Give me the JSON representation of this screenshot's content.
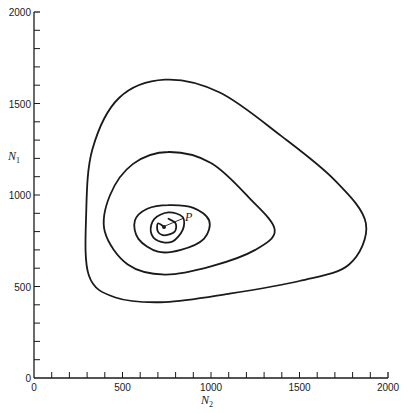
{
  "chart_data": {
    "type": "line",
    "title": "",
    "xlabel": "N2",
    "ylabel": "N1",
    "xlim": [
      0,
      2000
    ],
    "ylim": [
      0,
      2000
    ],
    "grid": false,
    "legend": null,
    "x_ticks": [
      0,
      500,
      1000,
      1500,
      2000
    ],
    "y_ticks": [
      0,
      500,
      1000,
      1500,
      2000
    ],
    "x_minor_step": 100,
    "y_minor_step": 100,
    "annotations": [
      {
        "text": "P",
        "x": 735,
        "y": 825,
        "description": "equilibrium point (spiral center)"
      }
    ],
    "series": [
      {
        "name": "trajectory-loop-1 (outer)",
        "points": [
          [
            740,
            1630
          ],
          [
            1050,
            1560
          ],
          [
            1400,
            1320
          ],
          [
            1700,
            1080
          ],
          [
            1875,
            845
          ],
          [
            1780,
            620
          ],
          [
            1500,
            530
          ],
          [
            1100,
            460
          ],
          [
            740,
            415
          ],
          [
            460,
            440
          ],
          [
            310,
            560
          ],
          [
            295,
            900
          ],
          [
            330,
            1250
          ],
          [
            480,
            1530
          ],
          [
            740,
            1630
          ]
        ]
      },
      {
        "name": "trajectory-loop-2",
        "points": [
          [
            760,
            1235
          ],
          [
            1000,
            1175
          ],
          [
            1220,
            980
          ],
          [
            1360,
            810
          ],
          [
            1250,
            700
          ],
          [
            1000,
            610
          ],
          [
            740,
            565
          ],
          [
            530,
            620
          ],
          [
            400,
            800
          ],
          [
            430,
            1000
          ],
          [
            560,
            1170
          ],
          [
            760,
            1235
          ]
        ]
      },
      {
        "name": "trajectory-loop-3",
        "points": [
          [
            760,
            945
          ],
          [
            900,
            930
          ],
          [
            990,
            860
          ],
          [
            960,
            760
          ],
          [
            830,
            700
          ],
          [
            700,
            690
          ],
          [
            590,
            760
          ],
          [
            570,
            860
          ],
          [
            640,
            925
          ],
          [
            760,
            945
          ]
        ]
      },
      {
        "name": "trajectory-loop-4",
        "points": [
          [
            760,
            905
          ],
          [
            840,
            880
          ],
          [
            840,
            810
          ],
          [
            780,
            745
          ],
          [
            700,
            750
          ],
          [
            660,
            800
          ],
          [
            680,
            870
          ],
          [
            760,
            905
          ]
        ]
      },
      {
        "name": "trajectory-loop-5 (inner)",
        "points": [
          [
            760,
            870
          ],
          [
            800,
            845
          ],
          [
            795,
            800
          ],
          [
            740,
            780
          ],
          [
            700,
            800
          ],
          [
            700,
            845
          ],
          [
            735,
            825
          ]
        ]
      }
    ]
  },
  "axes": {
    "x_tick_labels": [
      "0",
      "500",
      "1000",
      "1500",
      "2000"
    ],
    "y_tick_labels": [
      "0",
      "500",
      "1000",
      "1500",
      "2000"
    ],
    "x_label_main": "N",
    "x_label_sub": "2",
    "y_label_main": "N",
    "y_label_sub": "1",
    "point_label": "P"
  }
}
